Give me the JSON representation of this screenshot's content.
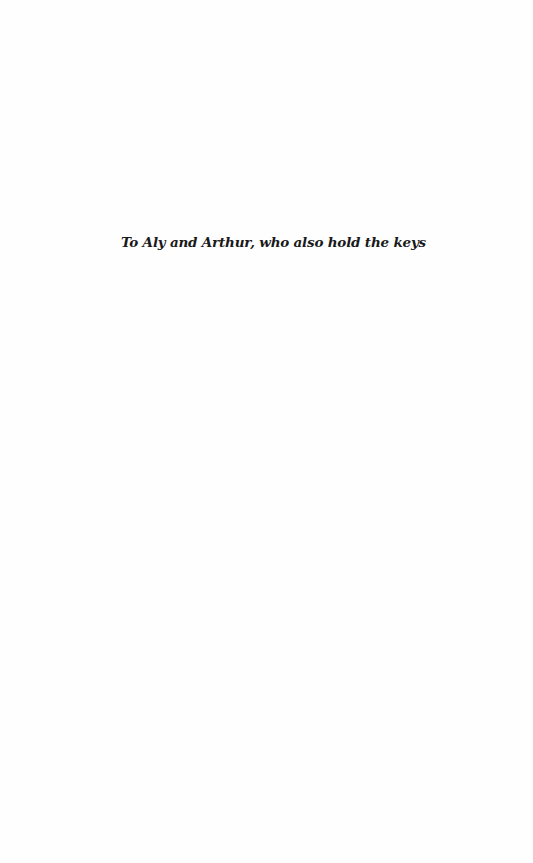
{
  "page": {
    "type": "dedication",
    "dedication_text": "To Aly and Arthur, who also hold the keys"
  }
}
